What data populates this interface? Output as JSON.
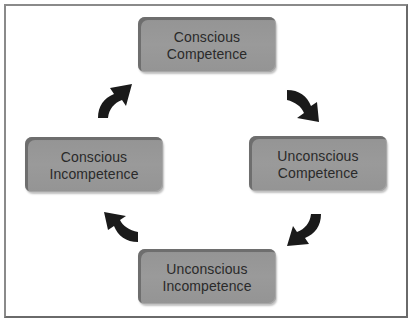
{
  "diagram": {
    "type": "cycle",
    "title": "",
    "direction": "clockwise",
    "colors": {
      "box_fill": "#9a9a9a",
      "box_edge": "#6e6e6e",
      "text": "#2a2a2a",
      "arrow": "#1a1a1a",
      "frame": "#7a7a7a"
    },
    "nodes": [
      {
        "id": "top",
        "line1": "Conscious",
        "line2": "Competence"
      },
      {
        "id": "right",
        "line1": "Unconscious",
        "line2": "Competence"
      },
      {
        "id": "bottom",
        "line1": "Unconscious",
        "line2": "Incompetence"
      },
      {
        "id": "left",
        "line1": "Conscious",
        "line2": "Incompetence"
      }
    ],
    "edges": [
      {
        "from": "bottom",
        "to": "left",
        "icon": "curved-arrow-up-left-icon"
      },
      {
        "from": "left",
        "to": "top",
        "icon": "curved-arrow-up-right-icon"
      },
      {
        "from": "top",
        "to": "right",
        "icon": "curved-arrow-down-right-icon"
      },
      {
        "from": "right",
        "to": "bottom",
        "icon": "curved-arrow-down-left-icon"
      }
    ]
  }
}
